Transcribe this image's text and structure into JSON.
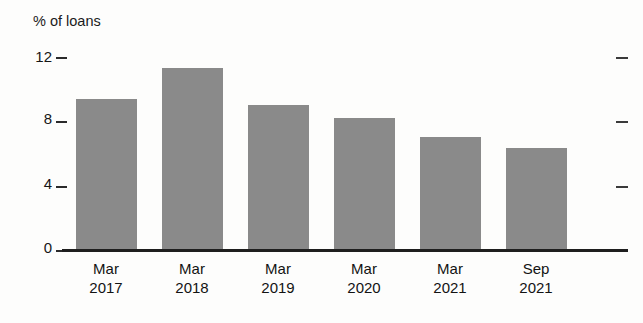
{
  "figure": {
    "title_remnant": "",
    "axis_label": "% of loans",
    "background_color": "#fdfdfc",
    "bar_color": "#8a8a8a",
    "axis_color": "#1e1e1e"
  },
  "chart_data": {
    "type": "bar",
    "title": "",
    "xlabel": "",
    "ylabel": "% of loans",
    "categories": [
      "Mar 2017",
      "Mar 2018",
      "Mar 2019",
      "Mar 2020",
      "Mar 2021",
      "Sep 2021"
    ],
    "category_lines": [
      {
        "month": "Mar",
        "year": "2017"
      },
      {
        "month": "Mar",
        "year": "2018"
      },
      {
        "month": "Mar",
        "year": "2019"
      },
      {
        "month": "Mar",
        "year": "2020"
      },
      {
        "month": "Mar",
        "year": "2021"
      },
      {
        "month": "Sep",
        "year": "2021"
      }
    ],
    "values": [
      9.4,
      11.3,
      9.0,
      8.2,
      7.0,
      6.3
    ],
    "ylim": [
      0,
      12.6
    ],
    "yticks": [
      0,
      4,
      8,
      12
    ],
    "ytick_labels": [
      "0",
      "4",
      "8",
      "12"
    ],
    "grid": false,
    "legend": null,
    "right_axis_ticks": [
      0,
      4,
      8,
      12
    ]
  }
}
